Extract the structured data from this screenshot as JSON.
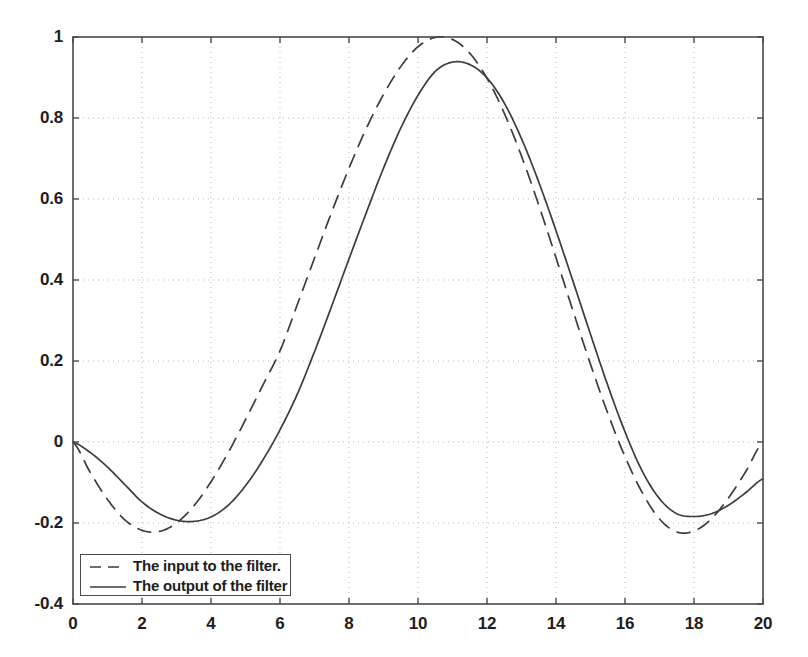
{
  "chart_data": {
    "type": "line",
    "title": "",
    "xlabel": "",
    "ylabel": "",
    "xlim": [
      0,
      20
    ],
    "ylim": [
      -0.4,
      1
    ],
    "xticks": [
      0,
      2,
      4,
      6,
      8,
      10,
      12,
      14,
      16,
      18,
      20
    ],
    "xtick_labels": [
      "0",
      "2",
      "4",
      "6",
      "8",
      "10",
      "12",
      "14",
      "16",
      "18",
      "20"
    ],
    "yticks": [
      -0.4,
      -0.2,
      0,
      0.2,
      0.4,
      0.6,
      0.8,
      1
    ],
    "ytick_labels": [
      "-0.4",
      "-0.2",
      "0",
      "0.2",
      "0.4",
      "0.6",
      "0.8",
      "1"
    ],
    "grid": true,
    "grid_style": "dotted",
    "grid_color": "#b9b9b9",
    "axis_color": "#4a4a4a",
    "background": "#ffffff",
    "legend_position": "lower left",
    "series": [
      {
        "name": "The input to the filter.",
        "style": "dashed",
        "color": "#3c3c3c",
        "x": [
          0,
          0.5,
          1,
          1.5,
          2,
          2.5,
          3,
          3.5,
          4,
          4.5,
          5,
          5.5,
          6,
          6.5,
          7,
          7.5,
          8,
          8.5,
          9,
          9.5,
          10,
          10.5,
          11,
          11.5,
          12,
          12.5,
          13,
          13.5,
          14,
          14.5,
          15,
          15.5,
          16,
          16.5,
          17,
          17.5,
          18,
          18.5,
          19,
          19.5,
          20
        ],
        "y": [
          0,
          -0.075,
          -0.142,
          -0.192,
          -0.218,
          -0.221,
          -0.2,
          -0.158,
          -0.098,
          -0.026,
          0.055,
          0.14,
          0.225,
          0.339,
          0.454,
          0.568,
          0.676,
          0.774,
          0.858,
          0.927,
          0.976,
          0.999,
          0.994,
          0.96,
          0.898,
          0.812,
          0.706,
          0.585,
          0.455,
          0.322,
          0.192,
          0.071,
          -0.036,
          -0.125,
          -0.19,
          -0.222,
          -0.22,
          -0.19,
          -0.138,
          -0.073,
          0
        ]
      },
      {
        "name": "The output of the filter",
        "style": "solid",
        "color": "#3c3c3c",
        "x": [
          0,
          0.5,
          1,
          1.5,
          2,
          2.5,
          3,
          3.5,
          4,
          4.5,
          5,
          5.5,
          6,
          6.5,
          7,
          7.5,
          8,
          8.5,
          9,
          9.5,
          10,
          10.5,
          11,
          11.5,
          12,
          12.5,
          13,
          13.5,
          14,
          14.5,
          15,
          15.5,
          16,
          16.5,
          17,
          17.5,
          18,
          18.5,
          19,
          19.5,
          20
        ],
        "y": [
          0,
          -0.026,
          -0.062,
          -0.105,
          -0.148,
          -0.177,
          -0.193,
          -0.196,
          -0.185,
          -0.156,
          -0.108,
          -0.045,
          0.03,
          0.118,
          0.223,
          0.336,
          0.452,
          0.566,
          0.676,
          0.775,
          0.856,
          0.915,
          0.938,
          0.932,
          0.899,
          0.837,
          0.749,
          0.642,
          0.522,
          0.395,
          0.266,
          0.14,
          0.025,
          -0.072,
          -0.14,
          -0.177,
          -0.184,
          -0.177,
          -0.156,
          -0.125,
          -0.091
        ]
      }
    ]
  },
  "legend": {
    "entries": [
      {
        "label": "The input to the filter.",
        "style": "dashed"
      },
      {
        "label": "The output of the filter",
        "style": "solid"
      }
    ]
  }
}
